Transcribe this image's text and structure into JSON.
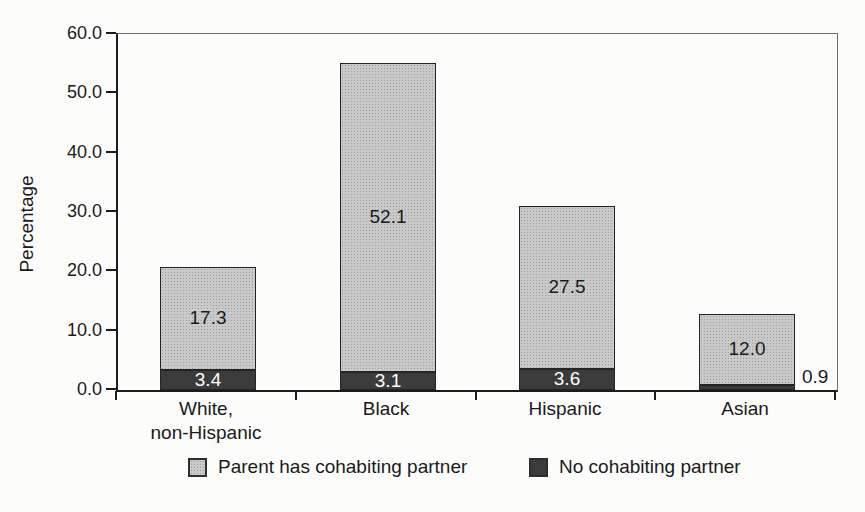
{
  "chart_data": {
    "type": "bar",
    "stacked": true,
    "orientation": "vertical",
    "categories": [
      "White,\nnon-Hispanic",
      "Black",
      "Hispanic",
      "Asian"
    ],
    "series": [
      {
        "name": "No cohabiting partner",
        "values": [
          3.4,
          3.1,
          3.6,
          0.9
        ],
        "color": "#3b3b3b",
        "label_color": "#ffffff"
      },
      {
        "name": "Parent has cohabiting partner",
        "values": [
          17.3,
          52.1,
          27.5,
          12.0
        ],
        "color": "#c9c9c9",
        "label_color": "#1a1a1a"
      }
    ],
    "totals": [
      20.7,
      55.2,
      31.1,
      12.9
    ],
    "title": "",
    "xlabel": "",
    "ylabel": "Percentage",
    "ylim": [
      0,
      60
    ],
    "ytick_step": 10,
    "yticks": [
      "60.0",
      "50.0",
      "40.0",
      "30.0",
      "20.0",
      "10.0",
      "0.0"
    ],
    "grid": false,
    "plot_border": "full-box",
    "value_label_decimals": 1,
    "legend_position": "bottom",
    "legend": [
      {
        "label": "Parent has cohabiting partner",
        "swatch": "light-halftone",
        "color": "#c9c9c9"
      },
      {
        "label": "No cohabiting partner",
        "swatch": "dark",
        "color": "#3b3b3b"
      }
    ]
  }
}
